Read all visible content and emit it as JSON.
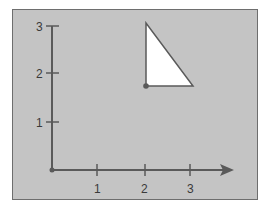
{
  "diagram": {
    "type": "coordinate-plane-triangle",
    "background_color": "#c4c4c4",
    "axis_color": "#5a5a5a",
    "shape_fill": "#ffffff",
    "x_axis": {
      "ticks": [
        "1",
        "2",
        "3"
      ],
      "has_arrow": true
    },
    "y_axis": {
      "ticks": [
        "1",
        "2",
        "3"
      ],
      "has_arrow": false
    },
    "origin_marker": true,
    "triangle": {
      "vertices": [
        [
          2,
          3
        ],
        [
          2,
          1.75
        ],
        [
          3,
          1.75
        ]
      ],
      "marked_vertex": [
        2,
        1.75
      ]
    }
  },
  "labels": {
    "x1": "1",
    "x2": "2",
    "x3": "3",
    "y1": "1",
    "y2": "2",
    "y3": "3"
  }
}
